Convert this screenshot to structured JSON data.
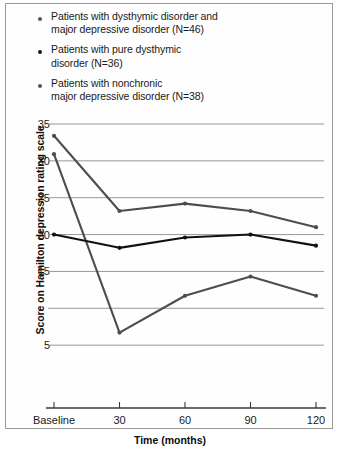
{
  "chart_data": {
    "type": "line",
    "title": "",
    "xlabel": "Time (months)",
    "ylabel": "Score on Hamilton depression rating scale",
    "categories": [
      "Baseline",
      "30",
      "60",
      "90",
      "120"
    ],
    "ylim": [
      0,
      35
    ],
    "yticks": [
      35,
      30,
      25,
      20,
      15,
      5
    ],
    "ytick_labels": [
      "35",
      "30",
      "25",
      "20",
      "15",
      "5"
    ],
    "gridlines": [
      35,
      30,
      25,
      20,
      15,
      10,
      5,
      0
    ],
    "grid": true,
    "legend_position": "above-plot",
    "series": [
      {
        "name": "Patients with dysthymic disorder and major depressive disorder (N=46)",
        "short_name": "dysthymic-and-mdd",
        "n": 46,
        "color": "#4d4d4d",
        "marker": "circle",
        "values": [
          30.9,
          6.7,
          11.7,
          14.3,
          11.7
        ]
      },
      {
        "name": "Patients with pure dysthymic disorder (N=36)",
        "short_name": "pure-dysthymic",
        "n": 36,
        "color": "#111111",
        "marker": "circle",
        "values": [
          20.0,
          18.2,
          19.6,
          20.0,
          18.5
        ]
      },
      {
        "name": "Patients with nonchronic major depressive disorder (N=38)",
        "short_name": "nonchronic-mdd",
        "n": 38,
        "color": "#4d4d4d",
        "marker": "circle",
        "values": [
          33.4,
          23.2,
          24.2,
          23.2,
          21.0
        ]
      }
    ]
  },
  "legend": {
    "items": [
      {
        "label": "Patients with dysthymic disorder and\nmajor depressive disorder (N=46)",
        "color": "#555555"
      },
      {
        "label": "Patients with pure dysthymic\ndisorder (N=36)",
        "color": "#1a1a1a"
      },
      {
        "label": "Patients with nonchronic\nmajor depressive disorder (N=38)",
        "color": "#555555"
      }
    ]
  },
  "axes": {
    "y_title": "Score on Hamilton depression rating scale",
    "x_title": "Time (months)",
    "y_tick_labels": [
      "35",
      "30",
      "25",
      "20",
      "15",
      "5"
    ],
    "x_tick_labels": [
      "Baseline",
      "30",
      "60",
      "90",
      "120"
    ]
  },
  "colors": {
    "grid": "#8c8c8c",
    "axis": "#3a3a3a",
    "series_gray": "#4d4d4d",
    "series_black": "#111111",
    "border": "#9a9a9a",
    "background": "#ffffff"
  }
}
